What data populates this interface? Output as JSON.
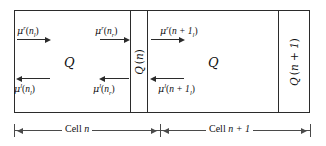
{
  "figure": {
    "type": "schematic-diagram",
    "line_color": "#2b2b2b",
    "dimension_color": "#4a4a4a",
    "text_color": "#111111",
    "background": "#ffffff"
  },
  "cells": {
    "cell_n": {
      "region_label": "Q",
      "top_flux": {
        "symbol": "μ",
        "superscript": "r",
        "open_paren": "(",
        "argument": "n",
        "subscript": "l",
        "close_paren": ")",
        "direction": "right"
      },
      "bottom_flux": {
        "symbol": "μ",
        "superscript": "l",
        "open_paren": "(",
        "argument": "n",
        "subscript": "l",
        "close_paren": ")",
        "direction": "left"
      },
      "top_flux_right": {
        "symbol": "μ",
        "superscript": "r",
        "open_paren": "(",
        "argument": "n",
        "subscript": "r",
        "close_paren": ")",
        "direction": "right"
      },
      "bottom_flux_right": {
        "symbol": "μ",
        "superscript": "l",
        "open_paren": "(",
        "argument": "n",
        "subscript": "r",
        "close_paren": ")",
        "direction": "left"
      }
    },
    "cell_n_plus_1": {
      "region_label": "Q",
      "top_flux": {
        "symbol": "μ",
        "superscript": "r",
        "open_paren": "(",
        "argument": "n + 1",
        "subscript": "l",
        "close_paren": ")",
        "direction": "right"
      },
      "bottom_flux": {
        "symbol": "μ",
        "superscript": "l",
        "open_paren": "(",
        "argument": "n + 1",
        "subscript": "l",
        "close_paren": ")",
        "direction": "left"
      }
    }
  },
  "interfaces": {
    "interface_n": {
      "symbol": "Q",
      "open_paren": "(",
      "argument": "n",
      "close_paren": ")",
      "rotation": "-90deg"
    },
    "interface_n_plus_1": {
      "symbol": "Q",
      "open_paren": "(",
      "argument": "n + 1",
      "close_paren": ")",
      "rotation": "-90deg"
    }
  },
  "dimensions": {
    "left_span": {
      "prefix": "Cell ",
      "argument": "n"
    },
    "right_span": {
      "prefix": "Cell ",
      "argument": "n + 1"
    }
  }
}
